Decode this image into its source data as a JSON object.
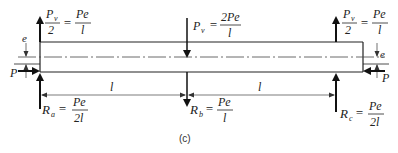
{
  "figure": {
    "caption": "(c)",
    "beam": {
      "left_x": 40,
      "right_x": 363,
      "top_y": 42,
      "bottom_y": 72,
      "axis_y": 57
    },
    "loads": {
      "top_left": {
        "lhs_num": "P",
        "lhs_sub": "v",
        "lhs_den": "2",
        "rhs_num": "Pe",
        "rhs_den": "l",
        "direction": "up"
      },
      "top_center": {
        "lhs": "P",
        "lhs_sub": "v",
        "rhs_num": "2Pe",
        "rhs_den": "l",
        "direction": "down"
      },
      "top_right": {
        "lhs_num": "P",
        "lhs_sub": "v",
        "lhs_den": "2",
        "rhs_num": "Pe",
        "rhs_den": "l",
        "direction": "up"
      },
      "axial_left": {
        "label": "P",
        "direction": "right"
      },
      "axial_right": {
        "label": "P",
        "direction": "left"
      },
      "eccentricity_left": "e",
      "eccentricity_right": "e"
    },
    "reactions": {
      "a": {
        "sym": "R",
        "sub": "a",
        "num": "Pe",
        "den": "2l",
        "direction": "up"
      },
      "b": {
        "sym": "R",
        "sub": "b",
        "num": "Pe",
        "den": "l",
        "direction": "down"
      },
      "c": {
        "sym": "R",
        "sub": "c",
        "num": "Pe",
        "den": "2l",
        "direction": "up"
      }
    },
    "dimensions": [
      {
        "label": "l",
        "from": "a",
        "to": "b"
      },
      {
        "label": "l",
        "from": "b",
        "to": "c"
      }
    ],
    "eq": "="
  }
}
